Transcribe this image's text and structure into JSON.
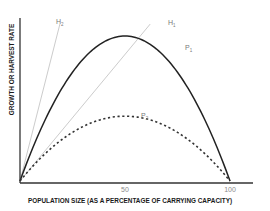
{
  "chart_data": {
    "type": "line",
    "title": "",
    "xlabel": "POPULATION SIZE (AS A PERCENTAGE OF CARRYING CAPACITY)",
    "ylabel": "GROWTH OR HARVEST RATE",
    "xlim": [
      0,
      100
    ],
    "ylim": [
      0,
      1.0
    ],
    "xticks": [
      {
        "value": 50,
        "label": "50"
      },
      {
        "value": 100,
        "label": "100"
      }
    ],
    "grid": false,
    "series": [
      {
        "name": "P1",
        "label_main": "P",
        "label_sub": "1",
        "style": "solid",
        "color": "#222222",
        "kind": "parabola",
        "peak_x": 50,
        "peak_y": 0.85
      },
      {
        "name": "P2",
        "label_main": "P",
        "label_sub": "2",
        "style": "dotted",
        "color": "#333333",
        "kind": "parabola",
        "peak_x": 50,
        "peak_y": 0.38
      },
      {
        "name": "H1",
        "label_main": "H",
        "label_sub": "1",
        "style": "solid",
        "color": "#cccccc",
        "kind": "line",
        "x": [
          0,
          62
        ],
        "y": [
          0,
          0.92
        ]
      },
      {
        "name": "H2",
        "label_main": "H",
        "label_sub": "2",
        "style": "solid",
        "color": "#cccccc",
        "kind": "line",
        "x": [
          0,
          19
        ],
        "y": [
          0,
          0.92
        ]
      }
    ]
  }
}
